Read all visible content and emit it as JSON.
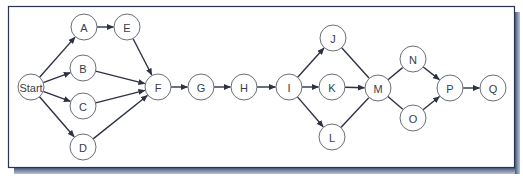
{
  "diagram": {
    "type": "network-diagram",
    "frame": {
      "x": 8,
      "y": 6,
      "width": 506,
      "height": 161,
      "border_color": "#2a3350",
      "shadow_color": "#5b6b8c",
      "background": "#ffffff"
    },
    "node_radius": 13,
    "nodes": [
      {
        "id": "start",
        "label": "Start",
        "x": 31,
        "y": 87
      },
      {
        "id": "A",
        "label": "A",
        "x": 84,
        "y": 27
      },
      {
        "id": "B",
        "label": "B",
        "x": 83,
        "y": 68
      },
      {
        "id": "C",
        "label": "C",
        "x": 83,
        "y": 106
      },
      {
        "id": "D",
        "label": "D",
        "x": 83,
        "y": 147
      },
      {
        "id": "E",
        "label": "E",
        "x": 127,
        "y": 27
      },
      {
        "id": "F",
        "label": "F",
        "x": 158,
        "y": 87
      },
      {
        "id": "G",
        "label": "G",
        "x": 201,
        "y": 87
      },
      {
        "id": "H",
        "label": "H",
        "x": 244,
        "y": 87
      },
      {
        "id": "I",
        "label": "I",
        "x": 289,
        "y": 87
      },
      {
        "id": "J",
        "label": "J",
        "x": 333,
        "y": 38
      },
      {
        "id": "K",
        "label": "K",
        "x": 332,
        "y": 87
      },
      {
        "id": "L",
        "label": "L",
        "x": 332,
        "y": 137
      },
      {
        "id": "M",
        "label": "M",
        "x": 378,
        "y": 88
      },
      {
        "id": "N",
        "label": "N",
        "x": 413,
        "y": 59
      },
      {
        "id": "O",
        "label": "O",
        "x": 413,
        "y": 118
      },
      {
        "id": "P",
        "label": "P",
        "x": 450,
        "y": 88
      },
      {
        "id": "Q",
        "label": "Q",
        "x": 493,
        "y": 88
      }
    ],
    "edges": [
      {
        "from": "start",
        "to": "A",
        "arrow": true
      },
      {
        "from": "start",
        "to": "B",
        "arrow": true
      },
      {
        "from": "start",
        "to": "C",
        "arrow": true
      },
      {
        "from": "start",
        "to": "D",
        "arrow": true
      },
      {
        "from": "A",
        "to": "E",
        "arrow": true
      },
      {
        "from": "E",
        "to": "F",
        "arrow": true
      },
      {
        "from": "B",
        "to": "F",
        "arrow": true
      },
      {
        "from": "C",
        "to": "F",
        "arrow": true
      },
      {
        "from": "D",
        "to": "F",
        "arrow": true
      },
      {
        "from": "F",
        "to": "G",
        "arrow": true
      },
      {
        "from": "G",
        "to": "H",
        "arrow": true
      },
      {
        "from": "H",
        "to": "I",
        "arrow": true
      },
      {
        "from": "I",
        "to": "J",
        "arrow": true
      },
      {
        "from": "I",
        "to": "K",
        "arrow": true
      },
      {
        "from": "I",
        "to": "L",
        "arrow": true
      },
      {
        "from": "J",
        "to": "M",
        "arrow": false
      },
      {
        "from": "K",
        "to": "M",
        "arrow": true
      },
      {
        "from": "L",
        "to": "M",
        "arrow": false
      },
      {
        "from": "M",
        "to": "N",
        "arrow": false
      },
      {
        "from": "M",
        "to": "O",
        "arrow": false
      },
      {
        "from": "N",
        "to": "P",
        "arrow": true
      },
      {
        "from": "O",
        "to": "P",
        "arrow": true
      },
      {
        "from": "P",
        "to": "Q",
        "arrow": true
      }
    ]
  }
}
